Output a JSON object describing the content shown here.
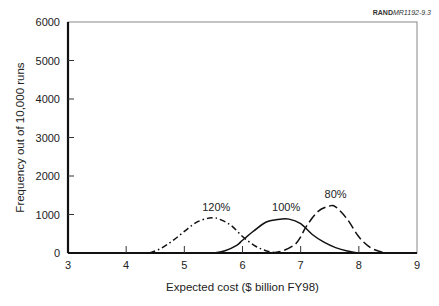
{
  "source_label": {
    "bold": "RAND",
    "italic": "MR1192-9.3"
  },
  "chart_data": {
    "type": "line",
    "title": "",
    "xlabel": "Expected cost ($ billion FY98)",
    "ylabel": "Frequency out of 10,000 runs",
    "xlim": [
      3,
      9
    ],
    "ylim": [
      0,
      6000
    ],
    "xticks": [
      3,
      4,
      5,
      6,
      7,
      8,
      9
    ],
    "yticks": [
      0,
      1000,
      2000,
      3000,
      4000,
      5000,
      6000
    ],
    "grid": false,
    "legend": "none (inline annotations)",
    "series": [
      {
        "name": "120%",
        "style": "dash-dot",
        "x": [
          4.4,
          4.6,
          4.8,
          5.0,
          5.2,
          5.4,
          5.5,
          5.6,
          5.8,
          6.0,
          6.2,
          6.4,
          6.6
        ],
        "y": [
          0,
          120,
          320,
          560,
          790,
          900,
          910,
          880,
          720,
          430,
          200,
          60,
          0
        ]
      },
      {
        "name": "100%",
        "style": "solid",
        "x": [
          5.5,
          5.7,
          5.9,
          6.0,
          6.2,
          6.4,
          6.6,
          6.8,
          7.0,
          7.2,
          7.4,
          7.6,
          7.8,
          8.0
        ],
        "y": [
          0,
          60,
          200,
          330,
          580,
          800,
          870,
          880,
          760,
          480,
          280,
          140,
          50,
          0
        ]
      },
      {
        "name": "80%",
        "style": "dashed",
        "x": [
          6.5,
          6.7,
          6.9,
          7.0,
          7.1,
          7.3,
          7.5,
          7.6,
          7.8,
          8.0,
          8.2,
          8.4,
          8.5
        ],
        "y": [
          0,
          60,
          220,
          420,
          700,
          1080,
          1220,
          1200,
          880,
          420,
          140,
          20,
          0
        ]
      }
    ],
    "annotations": [
      {
        "text": "120%",
        "x": 5.55,
        "y": 1100
      },
      {
        "text": "100%",
        "x": 6.75,
        "y": 1100
      },
      {
        "text": "80%",
        "x": 7.6,
        "y": 1420
      }
    ]
  }
}
